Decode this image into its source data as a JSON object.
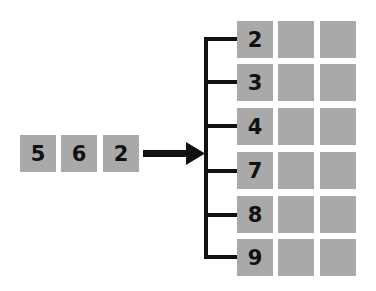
{
  "diagram": {
    "input_digits": [
      "5",
      "6",
      "2"
    ],
    "output_rows": [
      {
        "label": "2"
      },
      {
        "label": "3"
      },
      {
        "label": "4"
      },
      {
        "label": "7"
      },
      {
        "label": "8"
      },
      {
        "label": "9"
      }
    ],
    "empty_cells_per_row": 2,
    "colors": {
      "cell": "#a9a9a9",
      "line": "#111111",
      "text": "#111111"
    }
  }
}
